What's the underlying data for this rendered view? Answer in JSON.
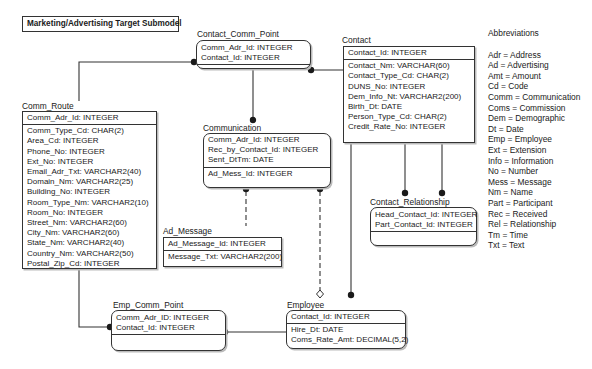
{
  "title": "Marketing/Advertising Target Submodel",
  "entities": {
    "contact_comm_point": {
      "name": "Contact_Comm_Point",
      "keys": [
        "Comm_Adr_Id: INTEGER",
        "Contact_Id: INTEGER"
      ],
      "attributes": []
    },
    "contact": {
      "name": "Contact",
      "keys": [
        "Contact_Id: INTEGER"
      ],
      "attributes": [
        "Contact_Nm: VARCHAR(60)",
        "Contact_Type_Cd: CHAR(2)",
        "DUNS_No: INTEGER",
        "Dem_Info_Nt: VARCHAR2(200)",
        "Birth_Dt: DATE",
        "Person_Type_Cd: CHAR(2)",
        "Credit_Rate_No: INTEGER"
      ]
    },
    "comm_route": {
      "name": "Comm_Route",
      "keys": [
        "Comm_Adr_Id: INTEGER"
      ],
      "attributes": [
        "Comm_Type_Cd: CHAR(2)",
        "Area_Cd: INTEGER",
        "Phone_No: INTEGER",
        "Ext_No: INTEGER",
        "Email_Adr_Txt: VARCHAR2(40)",
        "Domain_Nm: VARCHAR2(25)",
        "Building_No: INTEGER",
        "Room_Type_Nm: VARCHAR2(10)",
        "Room_No: INTEGER",
        "Street_Nm: VARCHAR2(60)",
        "City_Nm: VARCHAR2(60)",
        "State_Nm: VARCHAR2(40)",
        "Country_Nm: VARCHAR2(50)",
        "Postal_Zip_Cd: INTEGER"
      ]
    },
    "communication": {
      "name": "Communication",
      "keys": [
        "Comm_Adr_Id: INTEGER",
        "Rec_by_Contact_Id: INTEGER",
        "Sent_DtTm: DATE"
      ],
      "attributes": [
        "Ad_Mess_Id: INTEGER"
      ]
    },
    "ad_message": {
      "name": "Ad_Message",
      "keys": [
        "Ad_Message_Id: INTEGER"
      ],
      "attributes": [
        "Message_Txt: VARCHAR2(200)"
      ]
    },
    "contact_relationship": {
      "name": "Contact_Relationship",
      "keys": [
        "Head_Contact_Id: INTEGER",
        "Part_Contact_Id: INTEGER"
      ],
      "attributes": []
    },
    "emp_comm_point": {
      "name": "Emp_Comm_Point",
      "keys": [
        "Comm_Adr_ID: INTEGER",
        "Contact_Id: INTEGER"
      ],
      "attributes": []
    },
    "employee": {
      "name": "Employee",
      "keys": [
        "Contact_Id: INTEGER"
      ],
      "attributes": [
        "Hire_Dt: DATE",
        "Coms_Rate_Amt: DECIMAL(5,2)"
      ]
    }
  },
  "abbreviations": {
    "title": "Abbreviations",
    "items": [
      "Adr = Address",
      "Ad = Advertising",
      "Amt = Amount",
      "Cd = Code",
      "Comm = Communication",
      "Coms = Commission",
      "Dem = Demographic",
      "Dt = Date",
      "Emp = Employee",
      "Ext = Extension",
      "Info = Information",
      "No = Number",
      "Mess = Message",
      "Nm = Name",
      "Part = Participant",
      "Rec = Received",
      "Rel = Relationship",
      "Tm = Time",
      "Txt = Text"
    ]
  },
  "relationships": [
    {
      "from": "Comm_Route",
      "to": "Contact_Comm_Point",
      "style": "solid",
      "end": "dot"
    },
    {
      "from": "Contact",
      "to": "Contact_Comm_Point",
      "style": "solid",
      "end": "dot"
    },
    {
      "from": "Contact_Comm_Point",
      "to": "Communication",
      "style": "solid",
      "end": "dot"
    },
    {
      "from": "Communication",
      "to": "Ad_Message",
      "style": "dashed",
      "end": "dot"
    },
    {
      "from": "Communication",
      "to": "Employee",
      "style": "dashed",
      "end": "dot+diamond"
    },
    {
      "from": "Contact",
      "to": "Contact_Relationship",
      "style": "solid",
      "end": "dot",
      "count": 2
    },
    {
      "from": "Contact",
      "to": "Employee",
      "style": "solid",
      "end": "dot"
    },
    {
      "from": "Comm_Route",
      "to": "Emp_Comm_Point",
      "style": "solid",
      "end": "dot"
    },
    {
      "from": "Employee",
      "to": "Emp_Comm_Point",
      "style": "solid",
      "end": "dot"
    }
  ]
}
